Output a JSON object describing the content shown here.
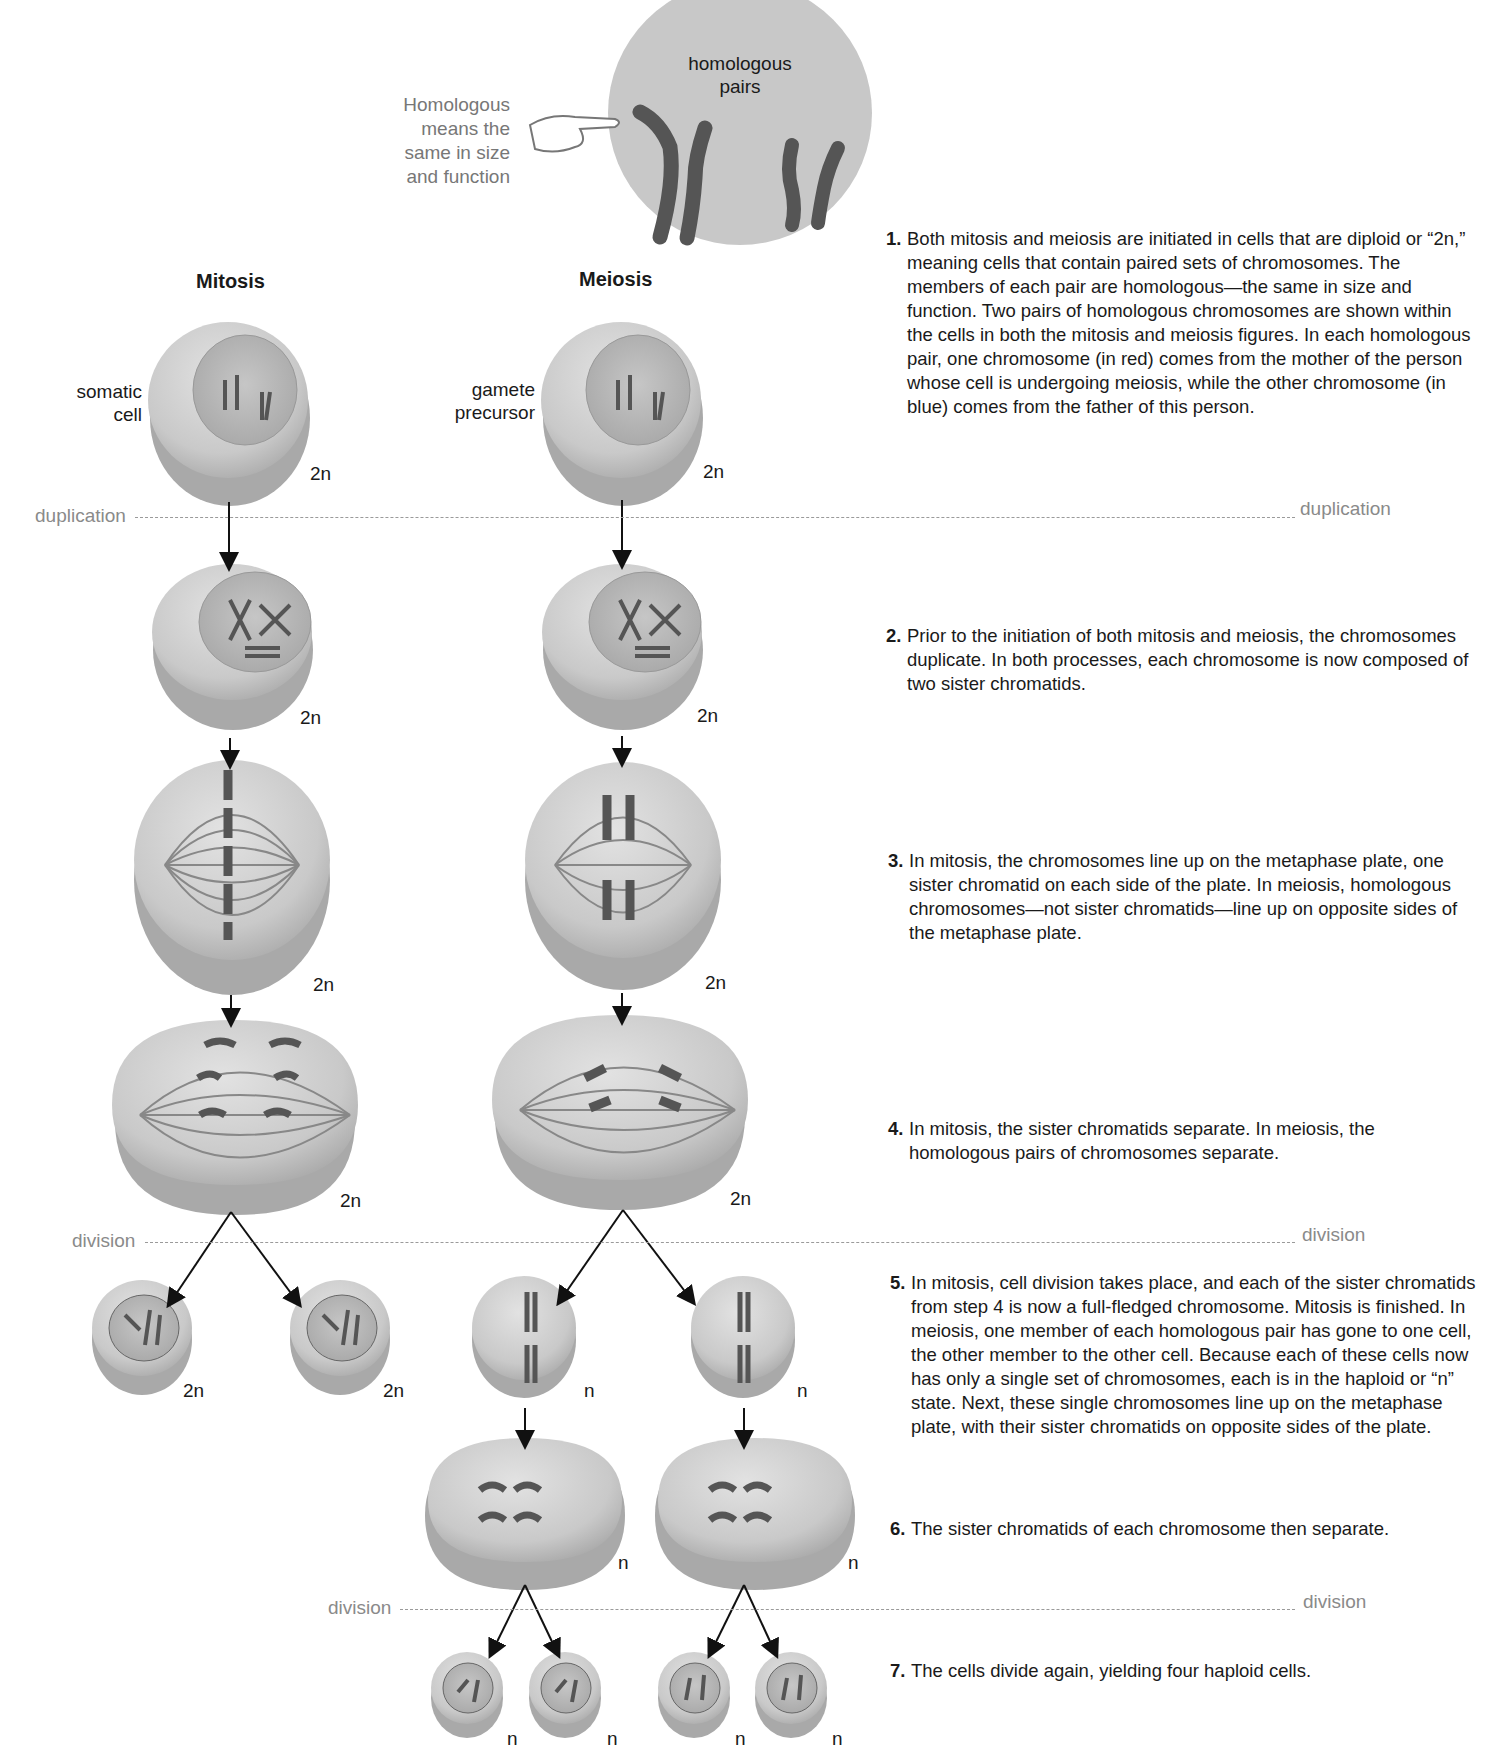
{
  "header": {
    "homologous_note": [
      "Homologous",
      "means the",
      "same in size",
      "and function"
    ],
    "homologous_pairs_label": [
      "homologous",
      "pairs"
    ]
  },
  "columns": {
    "mitosis_title": "Mitosis",
    "meiosis_title": "Meiosis"
  },
  "cell_labels": {
    "somatic": [
      "somatic",
      "cell"
    ],
    "gamete": [
      "gamete",
      "precursor"
    ]
  },
  "ploidy": {
    "diploid": "2n",
    "haploid": "n"
  },
  "dividers": {
    "duplication": "duplication",
    "division": "division"
  },
  "steps": [
    {
      "num": "1.",
      "text": "Both mitosis and meiosis are initiated in cells that are diploid or “2n,” meaning cells that contain paired sets of chromosomes. The members of each pair are homologous—the same in size and function. Two pairs of homologous chromosomes are shown within the cells in both the mitosis and meiosis figures. In each homologous pair, one chromosome (in red) comes from the mother of the person whose cell is undergoing meiosis, while the other chromosome (in blue) comes from the father of this person."
    },
    {
      "num": "2.",
      "text": "Prior to the initiation of both mitosis and meiosis, the chromosomes duplicate. In both processes, each chromosome is now composed of two sister chromatids."
    },
    {
      "num": "3.",
      "text": "In mitosis, the chromosomes line up on the metaphase plate, one sister chromatid on each side of the plate. In meiosis, homologous chromosomes—not sister chromatids—line up on opposite sides of the metaphase plate."
    },
    {
      "num": "4.",
      "text": "In mitosis, the sister chromatids separate. In meiosis, the homologous pairs of chromosomes separate."
    },
    {
      "num": "5.",
      "text": "In mitosis, cell division takes place, and each of the sister chromatids from step 4 is now a full-fledged chromosome. Mitosis is finished. In meiosis, one member of each homologous pair has gone to one cell, the other member to the other cell. Because each of these cells now has only a single set of chromosomes, each is in the haploid or “n” state. Next, these single chromosomes line up on the metaphase plate, with their sister chromatids on opposite sides of the plate."
    },
    {
      "num": "6.",
      "text": "The sister chromatids of each chromosome then separate."
    },
    {
      "num": "7.",
      "text": "The cells divide again, yielding four haploid cells."
    }
  ],
  "colors": {
    "cell_fill": "#cfcfcf",
    "cell_shadow": "#9d9d9d",
    "nucleus_fill": "#bdbdbd",
    "chromosome": "#5a5a5a",
    "divider": "#9a9a9a",
    "divider_text": "#8a8a8a"
  }
}
